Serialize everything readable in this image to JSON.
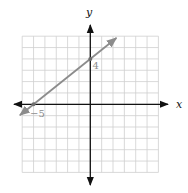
{
  "chart_data": {
    "type": "line",
    "title": "",
    "xlabel": "x",
    "ylabel": "y",
    "xlim": [
      -6,
      6
    ],
    "ylim": [
      -6,
      6
    ],
    "grid": true,
    "grid_step": 1,
    "series": [
      {
        "name": "line through (-5, 0) and (0, 4)",
        "points": [
          [
            -5,
            0
          ],
          [
            0,
            4
          ]
        ],
        "slope": 0.8,
        "y_intercept": 4,
        "x_intercept": -5,
        "arrows_both_ends": true,
        "color": "#8c8c8c"
      }
    ],
    "annotations": [
      {
        "text": "4",
        "x": 0,
        "y": 4,
        "position": "below-right"
      },
      {
        "text": "−5",
        "x": -5,
        "y": 0,
        "position": "below-right"
      }
    ]
  },
  "labels": {
    "x_axis": "x",
    "y_axis": "y",
    "y_intercept": "4",
    "x_intercept": "−5"
  },
  "colors": {
    "grid": "#cfcfcf",
    "axes": "#111111",
    "line": "#8c8c8c",
    "annotation": "#8c8c8c"
  }
}
